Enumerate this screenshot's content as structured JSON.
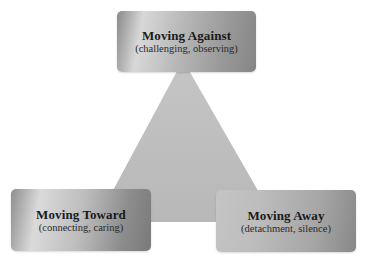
{
  "diagram": {
    "type": "triangle-of-boxes",
    "nodes": [
      {
        "id": "against",
        "title": "Moving Against",
        "subtitle": "(challenging, observing)",
        "position": "top"
      },
      {
        "id": "toward",
        "title": "Moving Toward",
        "subtitle": "(connecting, caring)",
        "position": "bottom-left"
      },
      {
        "id": "away",
        "title": "Moving Away",
        "subtitle": "(detachment, silence)",
        "position": "bottom-right"
      }
    ],
    "colors": {
      "triangle_fill": "#b9b9b9",
      "box_light": "#d8d8d8",
      "box_dark": "#858585",
      "text": "#1a1a1a",
      "background": "#ffffff"
    }
  }
}
